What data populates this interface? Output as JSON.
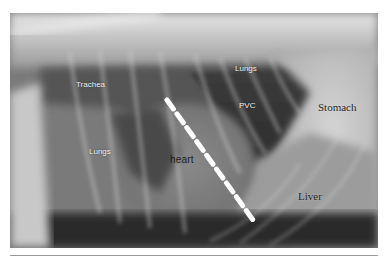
{
  "image": {
    "description": "Lateral thoracic radiograph (X-ray) of a dog with anatomical labels and a dashed measurement line across the heart",
    "labels": {
      "trachea": "Trachea",
      "lungs_upper": "Lungs",
      "pvc": "PVC",
      "stomach": "Stomach",
      "lungs_lower": "Lungs",
      "heart": "heart",
      "liver": "Liver"
    },
    "measurement_line": {
      "style": "dashed",
      "color": "#ffffff",
      "start": [
        167,
        100
      ],
      "end": [
        253,
        220
      ]
    },
    "colors": {
      "background": "#ffffff",
      "xray_dark": "#1a1a1a",
      "xray_mid": "#707070",
      "xray_light": "#d8d8d8"
    }
  }
}
